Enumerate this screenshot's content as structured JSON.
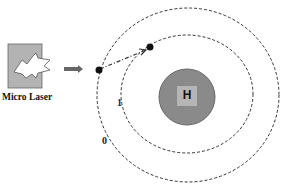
{
  "diagram": {
    "laser": {
      "label": "Micro Laser",
      "icon": "lightning-bolt-icon"
    },
    "beam_arrow": "right-arrow-icon",
    "nucleus": {
      "label": "H",
      "fill": "#8a8a8a",
      "inner_fill": "#b5b5b5"
    },
    "orbits": [
      {
        "label": "1",
        "description": "inner orbit"
      },
      {
        "label": "0",
        "description": "outer orbit"
      }
    ],
    "electrons": [
      {
        "position": "outer orbit, left"
      },
      {
        "position": "inner orbit, top"
      }
    ],
    "transition_arrow": "dash-dot arrow from outer electron to inner electron",
    "colors": {
      "line": "#333333",
      "laser_box": "#b0b0b0"
    }
  }
}
